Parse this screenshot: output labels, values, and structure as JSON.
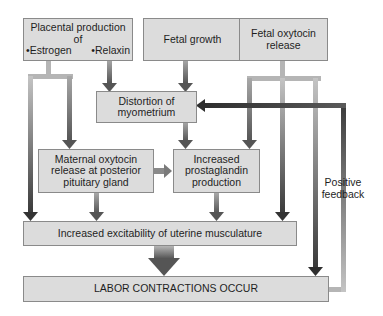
{
  "diagram": {
    "type": "flowchart",
    "topic": "Factors in initiation of labor (positive feedback)",
    "nodes": {
      "placental": {
        "line1": "Placental production",
        "line2": "of",
        "bullet1": "•Estrogen",
        "bullet2": "•Relaxin"
      },
      "fetal_growth": {
        "text": "Fetal growth"
      },
      "fetal_oxytocin": {
        "line1": "Fetal oxytocin",
        "line2": "release"
      },
      "distortion": {
        "line1": "Distortion of",
        "line2": "myometrium"
      },
      "maternal_oxytocin": {
        "line1": "Maternal oxytocin",
        "line2": "release at posterior",
        "line3": "pituitary gland"
      },
      "prostaglandin": {
        "line1": "Increased",
        "line2": "prostaglandin",
        "line3": "production"
      },
      "excitability": {
        "text": "Increased excitability of uterine musculature"
      },
      "labor": {
        "text": "LABOR CONTRACTIONS OCCUR"
      }
    },
    "feedback_label": {
      "line1": "Positive",
      "line2": "feedback"
    },
    "edges": [
      {
        "from": "placental",
        "to": "distortion"
      },
      {
        "from": "placental",
        "to": "maternal_oxytocin"
      },
      {
        "from": "placental",
        "to": "excitability"
      },
      {
        "from": "fetal_growth",
        "to": "distortion"
      },
      {
        "from": "fetal_oxytocin",
        "to": "prostaglandin"
      },
      {
        "from": "fetal_oxytocin",
        "to": "excitability"
      },
      {
        "from": "distortion",
        "to": "prostaglandin"
      },
      {
        "from": "maternal_oxytocin",
        "to": "prostaglandin"
      },
      {
        "from": "maternal_oxytocin",
        "to": "excitability"
      },
      {
        "from": "prostaglandin",
        "to": "excitability"
      },
      {
        "from": "excitability",
        "to": "labor"
      },
      {
        "from": "labor",
        "to": "distortion",
        "label": "Positive feedback"
      },
      {
        "from": "labor",
        "to": "labor",
        "via": "feedback-loop-to-fetal-oxytocin-line"
      }
    ],
    "colors": {
      "box_fill": "#dcdcdc",
      "box_border": "#8a8a8a",
      "arrow_dark": "#3a3a3a",
      "arrow_mid": "#7a7a7a",
      "arrow_light": "#b5b5b5",
      "background": "#ffffff"
    }
  }
}
